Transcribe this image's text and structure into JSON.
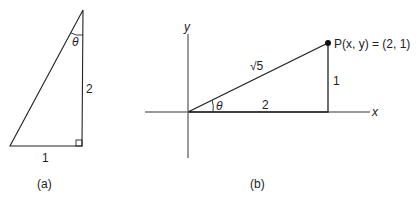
{
  "figure_a": {
    "caption": "(a)",
    "angle_label": "θ",
    "vertical_side_label": "2",
    "horizontal_side_label": "1"
  },
  "figure_b": {
    "caption": "(b)",
    "x_axis_label": "x",
    "y_axis_label": "y",
    "angle_label": "θ",
    "hypotenuse_label": "√5",
    "horizontal_side_label": "2",
    "vertical_side_label": "1",
    "point_label": "P(x, y) = (2, 1)"
  },
  "colors": {
    "line": "#222222",
    "axis": "#9a9a9a",
    "background": "#ffffff"
  }
}
